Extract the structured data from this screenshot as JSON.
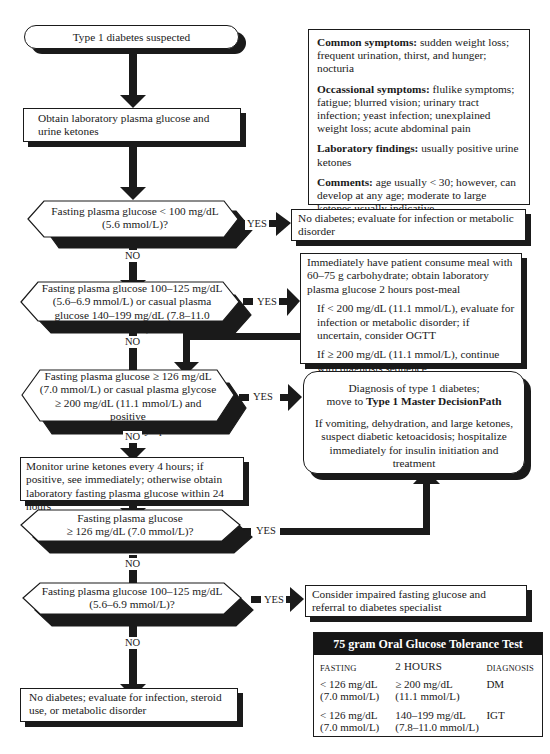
{
  "flowchart": {
    "start": "Type 1 diabetes suspected",
    "step_obtain": "Obtain laboratory plasma glucose and urine ketones",
    "decision1": {
      "text": "Fasting plasma glucose < 100 mg/dL (5.6 mmol/L)?",
      "yes": "YES",
      "no": "NO",
      "yes_result": "No diabetes; evaluate for infection or metabolic disorder"
    },
    "decision2": {
      "text": "Fasting plasma glucose 100–125 mg/dL (5.6–6.9 mmol/L) or casual plasma glucose 140–199 mg/dL (7.8–11.0 mmol/L)?",
      "yes": "YES",
      "no": "NO",
      "yes_result": {
        "main": "Immediately have patient consume meal with 60–75 g carbohydrate; obtain laboratory plasma glucose 2 hours post-meal",
        "if_less": "If < 200 mg/dL (11.1 mmol/L), evaluate for infection or metabolic disorder; if uncertain, consider OGTT",
        "if_greater": "If ≥ 200 mg/dL (11.1 mmol/L), continue with diagnosis sequence"
      }
    },
    "decision3": {
      "line1": "Fasting plasma glucose ≥ 126 mg/dL",
      "line2": "(7.0 mmol/L) or casual plasma glycose",
      "line3": "≥ 200 mg/dL (11.1 mmol/L) and positive",
      "line4": "urine ketones or symptoms?",
      "yes": "YES",
      "no": "NO"
    },
    "diagnosis": {
      "line1": "Diagnosis of type 1 diabetes;",
      "line2_prefix": "move to ",
      "line2_bold": "Type 1 Master DecisionPath",
      "note": "If vomiting, dehydration, and large ketones, suspect diabetic ketoacidosis; hospitalize immediately for insulin initiation and treatment"
    },
    "step_monitor": "Monitor urine ketones every 4 hours; if positive, see immediately; otherwise obtain laboratory fasting plasma glucose within 24 hours",
    "decision4": {
      "line1": "Fasting plasma glucose",
      "line2": "≥ 126 mg/dL (7.0 mmol/L)?",
      "yes": "YES",
      "no": "NO"
    },
    "decision5": {
      "line1": "Fasting plasma glucose 100–125 mg/dL",
      "line2": "(5.6–6.9 mmol/L)?",
      "yes": "YES",
      "no": "NO",
      "yes_result": "Consider impaired fasting glucose and referral to diabetes specialist"
    },
    "end_no": "No diabetes; evaluate for infection, steroid use, or metabolic disorder"
  },
  "info_box": {
    "common_label": "Common symptoms:",
    "common_text": " sudden weight loss; frequent urination, thirst, and hunger; nocturia",
    "occasional_label": "Occassional symptoms:",
    "occasional_text": " flulike symptoms; fatigue; blurred vision; urinary tract infection; yeast infection; unexplained weight loss; acute abdominal pain",
    "lab_label": "Laboratory findings:",
    "lab_text": " usually positive urine ketones",
    "comments_label": "Comments:",
    "comments_text": " age usually < 30; however, can develop at any age; moderate to large ketones usually indicative"
  },
  "ogtt": {
    "title": "75 gram Oral Glucose Tolerance Test",
    "headers": [
      "FASTING",
      "2 HOURS",
      "DIAGNOSIS"
    ],
    "rows": [
      {
        "fasting": "< 126 mg/dL",
        "fasting_mmol": "(7.0 mmol/L)",
        "two_hours": "≥ 200 mg/dL",
        "two_hours_mmol": "(11.1 mmol/L)",
        "diagnosis": "DM"
      },
      {
        "fasting": "< 126 mg/dL",
        "fasting_mmol": "(7.0 mmol/L)",
        "two_hours": "140–199 mg/dL",
        "two_hours_mmol": "(7.8–11.0 mmol/L)",
        "diagnosis": "IGT"
      }
    ]
  },
  "colors": {
    "ink": "#1a1a1a",
    "background": "#ffffff"
  }
}
